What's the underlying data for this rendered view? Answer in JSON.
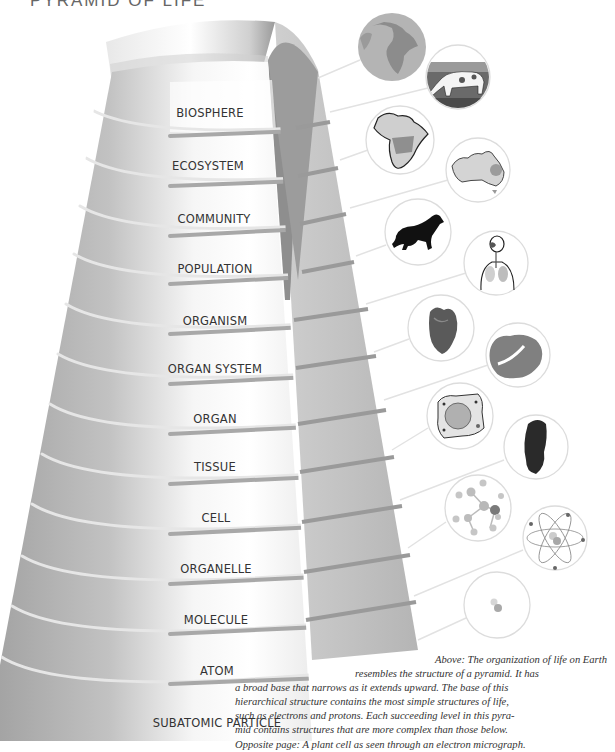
{
  "header": {
    "title": "PYRAMID OF LIFE"
  },
  "pyramid": {
    "levels": [
      {
        "label": "BIOSPHERE",
        "icon": "globe-icon"
      },
      {
        "label": "ECOSYSTEM",
        "icon": "cow-grassland-icon"
      },
      {
        "label": "COMMUNITY",
        "icon": "africa-map-icon"
      },
      {
        "label": "POPULATION",
        "icon": "australia-map-icon"
      },
      {
        "label": "ORGANISM",
        "icon": "horse-icon"
      },
      {
        "label": "ORGAN SYSTEM",
        "icon": "respiratory-system-icon"
      },
      {
        "label": "ORGAN",
        "icon": "heart-icon"
      },
      {
        "label": "TISSUE",
        "icon": "tissue-icon"
      },
      {
        "label": "CELL",
        "icon": "plant-cell-icon"
      },
      {
        "label": "ORGANELLE",
        "icon": "mitochondrion-icon"
      },
      {
        "label": "MOLECULE",
        "icon": "molecule-icon"
      },
      {
        "label": "ATOM",
        "icon": "atom-icon"
      },
      {
        "label": "SUBATOMIC PARTICLE",
        "icon": "subatomic-particle-icon"
      }
    ]
  },
  "caption": {
    "lines": [
      "Above: The organization of life on Earth",
      "resembles the structure of a pyramid. It has",
      "a broad base that narrows as it extends upward. The base of this",
      "hierarchical structure contains the most simple structures of life,",
      "such as electrons and protons. Each succeeding level in this pyra-",
      "mid  contains structures that are more complex than those below.",
      "Opposite page: A plant cell as seen through an electron micrograph."
    ]
  },
  "colors": {
    "front_face": "#f2f2f2",
    "side_face": "#a9a9a9",
    "back_face": "#c8c8c8",
    "groove": "#8f8f8f",
    "circle_border": "#dddddd",
    "leader_line": "#e0e0e0",
    "text": "#333333"
  }
}
